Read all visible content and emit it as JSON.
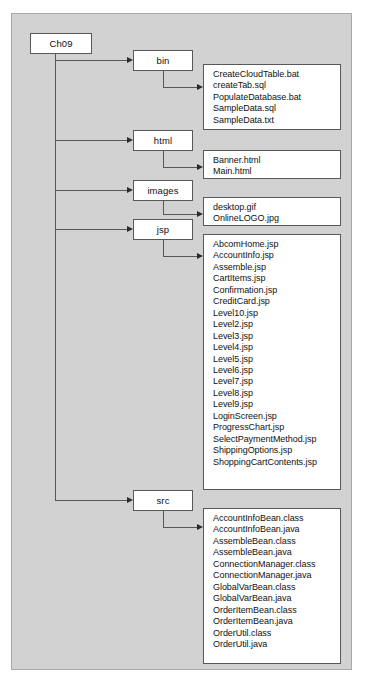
{
  "diagram": {
    "type": "directory-tree",
    "root": {
      "label": "Ch09"
    },
    "folders": [
      {
        "id": "bin",
        "label": "bin"
      },
      {
        "id": "html",
        "label": "html"
      },
      {
        "id": "images",
        "label": "images"
      },
      {
        "id": "jsp",
        "label": "jsp"
      },
      {
        "id": "src",
        "label": "src"
      }
    ],
    "file_groups": [
      {
        "parent": "bin",
        "files": [
          "CreateCloudTable.bat",
          "createTab.sql",
          "PopulateDatabase.bat",
          "SampleData.sql",
          "SampleData.txt"
        ]
      },
      {
        "parent": "html",
        "files": [
          "Banner.html",
          "Main.html"
        ]
      },
      {
        "parent": "images",
        "files": [
          "desktop.gif",
          "OnlineLOGO.jpg"
        ]
      },
      {
        "parent": "jsp",
        "files": [
          "AbcomHome.jsp",
          "AccountInfo.jsp",
          "Assemble.jsp",
          "CartItems.jsp",
          "Confirmation.jsp",
          "CreditCard.jsp",
          "Level10.jsp",
          "Level2.jsp",
          "Level3.jsp",
          "Level4.jsp",
          "Level5.jsp",
          "Level6.jsp",
          "Level7.jsp",
          "Level8.jsp",
          "Level9.jsp",
          "LoginScreen.jsp",
          "ProgressChart.jsp",
          "SelectPaymentMethod.jsp",
          "ShippingOptions.jsp",
          "ShoppingCartContents.jsp"
        ]
      },
      {
        "parent": "src",
        "files": [
          "AccountInfoBean.class",
          "AccountInfoBean.java",
          "AssembleBean.class",
          "AssembleBean.java",
          "ConnectionManager.class",
          "ConnectionManager.java",
          "GlobalVarBean.class",
          "GlobalVarBean.java",
          "OrderItemBean.class",
          "OrderItemBean.java",
          "OrderUtil.class",
          "OrderUtil.java"
        ]
      }
    ],
    "colors": {
      "panel_background": "#d2d2d2",
      "box_fill": "#ffffff",
      "box_border": "#58585a",
      "connector": "#58585a",
      "text": "#111111"
    }
  }
}
